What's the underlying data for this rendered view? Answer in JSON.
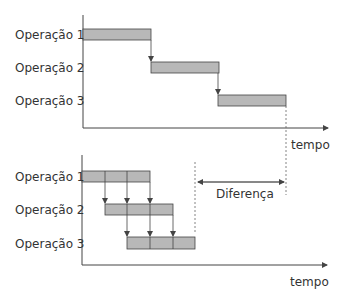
{
  "colors": {
    "bar_fill": "#b8b8b8",
    "bar_stroke": "#444444",
    "axis": "#444444",
    "text": "#333333"
  },
  "top_diagram": {
    "title": "Sequential processing",
    "rows": [
      {
        "label": "Operação 1",
        "start": 0,
        "end": 3,
        "segments": 1
      },
      {
        "label": "Operação 2",
        "start": 3,
        "end": 6,
        "segments": 1
      },
      {
        "label": "Operação 3",
        "start": 6,
        "end": 9,
        "segments": 1
      }
    ],
    "x_axis_label": "tempo"
  },
  "bottom_diagram": {
    "title": "Pipelined processing",
    "rows": [
      {
        "label": "Operação 1",
        "start": 0,
        "end": 3,
        "segments": 3
      },
      {
        "label": "Operação 2",
        "start": 1,
        "end": 4,
        "segments": 3
      },
      {
        "label": "Operação 3",
        "start": 2,
        "end": 5,
        "segments": 3
      }
    ],
    "x_axis_label": "tempo",
    "difference_label": "Diferença"
  }
}
